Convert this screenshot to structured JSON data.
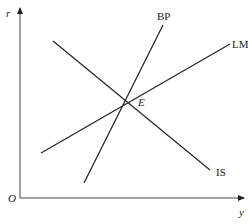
{
  "diagram": {
    "type": "IS-LM-BP equilibrium diagram",
    "axes": {
      "x_label": "y",
      "y_label": "r",
      "origin_label": "O"
    },
    "curves": [
      {
        "name": "IS",
        "label": "IS",
        "slope": "downward"
      },
      {
        "name": "LM",
        "label": "LM",
        "slope": "upward"
      },
      {
        "name": "BP",
        "label": "BP",
        "slope": "steep upward"
      }
    ],
    "equilibrium": {
      "label": "E"
    },
    "colors": {
      "line": "#222222",
      "background": "#ffffff"
    }
  }
}
